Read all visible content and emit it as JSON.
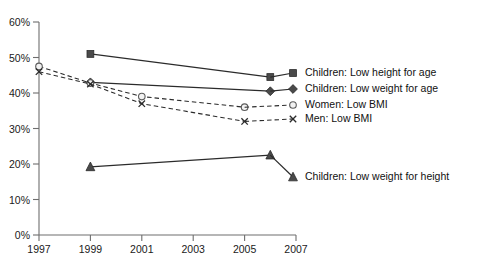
{
  "chart_data": {
    "type": "line",
    "title": "",
    "subtitle": "",
    "xlabel": "",
    "ylabel": "",
    "xlim": [
      1997,
      2007
    ],
    "ylim": [
      0,
      60
    ],
    "grid": false,
    "legend_position": "right-inline",
    "x_ticks": [
      "1997",
      "1999",
      "2001",
      "2003",
      "2005",
      "2007"
    ],
    "x_tick_values": [
      1997,
      1999,
      2001,
      2003,
      2005,
      2007
    ],
    "y_ticks": [
      "0%",
      "10%",
      "20%",
      "30%",
      "40%",
      "50%",
      "60%"
    ],
    "y_tick_values": [
      0,
      10,
      20,
      30,
      40,
      50,
      60
    ],
    "series": [
      {
        "name": "Children: Low height for age",
        "marker": "filled-square",
        "line_style": "solid",
        "x": [
          1999,
          2006
        ],
        "values": [
          51.0,
          44.5
        ]
      },
      {
        "name": "Children: Low weight for age",
        "marker": "filled-diamond",
        "line_style": "solid",
        "x": [
          1999,
          2006
        ],
        "values": [
          43.0,
          40.5
        ]
      },
      {
        "name": "Women: Low BMI",
        "marker": "open-circle",
        "line_style": "dashed",
        "x": [
          1997,
          1999,
          2001,
          2005
        ],
        "values": [
          47.5,
          42.8,
          39.0,
          36.0
        ]
      },
      {
        "name": "Men: Low BMI",
        "marker": "cross",
        "line_style": "dashed",
        "x": [
          1997,
          1999,
          2001,
          2005
        ],
        "values": [
          46.0,
          42.5,
          37.0,
          32.0
        ]
      },
      {
        "name": "Children: Low weight for height",
        "marker": "filled-triangle",
        "line_style": "solid",
        "x": [
          1999,
          2006
        ],
        "values": [
          19.2,
          22.5
        ]
      }
    ],
    "labels": [
      {
        "text": "Children: Low height for age",
        "x": 305,
        "y": 73
      },
      {
        "text": "Children: Low weight for age",
        "x": 305,
        "y": 89
      },
      {
        "text": "Women: Low BMI",
        "x": 305,
        "y": 105
      },
      {
        "text": "Men: Low BMI",
        "x": 305,
        "y": 119
      },
      {
        "text": "Children: Low weight for height",
        "x": 305,
        "y": 177
      }
    ]
  },
  "caption": {
    "text": ""
  },
  "colors": {
    "axis": "#6e6e6e",
    "line": "#2b2b2b",
    "marker_fill": "#4a4a4a",
    "marker_open_fill": "#f2f2f2",
    "text": "#111111",
    "background": "#ffffff"
  }
}
